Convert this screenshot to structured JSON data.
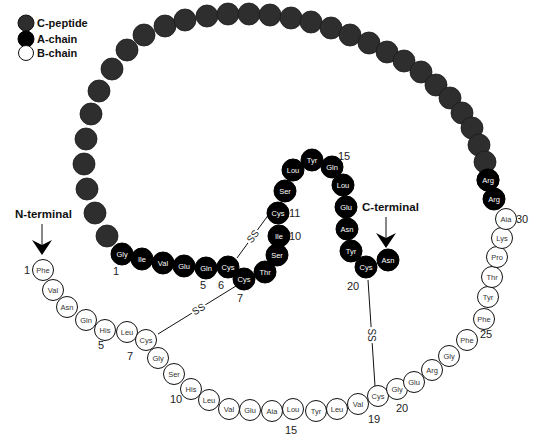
{
  "colors": {
    "c_peptide": "#2e2e2e",
    "a_chain": "#000000",
    "b_chain": "#ffffff",
    "stroke": "#111111",
    "a_text": "#ffffff",
    "b_text": "#333333"
  },
  "legend": [
    {
      "key": "c_peptide",
      "label": "C-peptide"
    },
    {
      "key": "a_chain",
      "label": "A-chain"
    },
    {
      "key": "b_chain",
      "label": "B-chain"
    }
  ],
  "terminals": {
    "n_terminal": "N-terminal",
    "c_terminal": "C-terminal"
  },
  "c_peptide": {
    "count": 31,
    "linker_a_side": [
      "Arg",
      "Arg"
    ]
  },
  "a_chain": {
    "residues": [
      "Gly",
      "Ile",
      "Val",
      "Glu",
      "Gln",
      "Cys",
      "Cys",
      "Thr",
      "Ser",
      "Ile",
      "Cys",
      "Ser",
      "Lou",
      "Tyr",
      "Gln",
      "Lou",
      "Glu",
      "Asn",
      "Tyr",
      "Cys",
      "Asn"
    ],
    "position_labels": [
      {
        "index": 1,
        "text": "1"
      },
      {
        "index": 5,
        "text": "5"
      },
      {
        "index": 6,
        "text": "6"
      },
      {
        "index": 7,
        "text": "7"
      },
      {
        "index": 10,
        "text": "10"
      },
      {
        "index": 11,
        "text": "11"
      },
      {
        "index": 15,
        "text": "15"
      },
      {
        "index": 20,
        "text": "20"
      }
    ]
  },
  "b_chain": {
    "residues": [
      "Phe",
      "Val",
      "Asn",
      "Gln",
      "His",
      "Leu",
      "Cys",
      "Gly",
      "Ser",
      "His",
      "Leu",
      "Val",
      "Glu",
      "Aia",
      "Lou",
      "Tyr",
      "Leu",
      "Val",
      "Cys",
      "Gly",
      "Glu",
      "Arg",
      "Gly",
      "Phe",
      "Phe",
      "Tyr",
      "Thr",
      "Pro",
      "Lys",
      "Aia"
    ],
    "position_labels": [
      {
        "index": 1,
        "text": "1"
      },
      {
        "index": 5,
        "text": "5"
      },
      {
        "index": 7,
        "text": "7"
      },
      {
        "index": 10,
        "text": "10"
      },
      {
        "index": 15,
        "text": "15"
      },
      {
        "index": 19,
        "text": "19"
      },
      {
        "index": 20,
        "text": "20"
      },
      {
        "index": 25,
        "text": "25"
      },
      {
        "index": 30,
        "text": "30"
      }
    ]
  },
  "disulfide_bonds": [
    {
      "from": "A6",
      "to": "A11",
      "label": "SS"
    },
    {
      "from": "A7",
      "to": "B7",
      "label": "SS"
    },
    {
      "from": "A20",
      "to": "B19",
      "label": "SS"
    }
  ]
}
